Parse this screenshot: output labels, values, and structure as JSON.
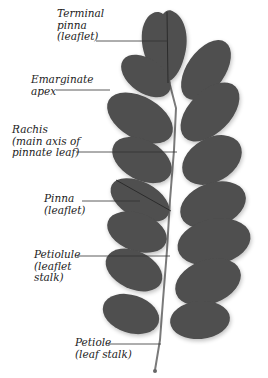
{
  "diagram": {
    "leaf_color": "#4f4f4f",
    "rachis_color": "#7a7a7a",
    "line_color": "#333333",
    "labels": [
      {
        "id": "terminal-pinna",
        "lines": [
          "Terminal",
          "pinna",
          "(leaflet)"
        ]
      },
      {
        "id": "emarginate-apex",
        "lines": [
          "Emarginate",
          "apex"
        ]
      },
      {
        "id": "rachis",
        "lines": [
          "Rachis",
          "(main axis of",
          "pinnate leaf)"
        ]
      },
      {
        "id": "pinna",
        "lines": [
          "Pinna",
          "(leaflet)"
        ]
      },
      {
        "id": "petiolule",
        "lines": [
          "Petiolule",
          "(leaflet",
          "stalk)"
        ]
      },
      {
        "id": "petiole",
        "lines": [
          "Petiole",
          "(leaf stalk)"
        ]
      }
    ]
  }
}
